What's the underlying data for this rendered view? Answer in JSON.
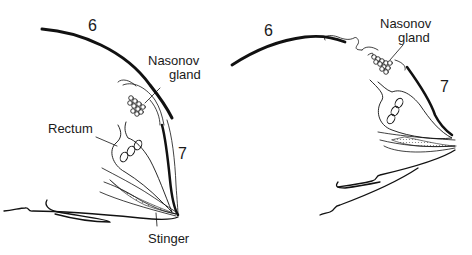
{
  "panels": [
    {
      "id": "left",
      "state": "gland-retracted",
      "labels": {
        "segment_6": "6",
        "segment_7": "7",
        "nasonov_line1": "Nasonov",
        "nasonov_line2": "gland",
        "rectum": "Rectum",
        "stinger": "Stinger"
      }
    },
    {
      "id": "right",
      "state": "gland-exposed",
      "labels": {
        "segment_6": "6",
        "segment_7": "7",
        "nasonov_line1": "Nasonov",
        "nasonov_line2": "gland"
      }
    }
  ],
  "colors": {
    "line": "#111111",
    "background": "#ffffff",
    "stipple": "#888888"
  }
}
